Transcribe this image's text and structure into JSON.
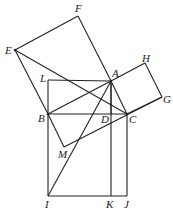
{
  "diagram": {
    "title": "",
    "points": {
      "A": {
        "x": 111,
        "y": 81,
        "label": "A"
      },
      "B": {
        "x": 48,
        "y": 114,
        "label": "B"
      },
      "C": {
        "x": 127,
        "y": 114,
        "label": "C"
      },
      "D": {
        "x": 111,
        "y": 114,
        "label": "D"
      },
      "E": {
        "x": 15,
        "y": 50,
        "label": "E"
      },
      "F": {
        "x": 78,
        "y": 16,
        "label": "F"
      },
      "G": {
        "x": 162,
        "y": 97,
        "label": "G"
      },
      "H": {
        "x": 145,
        "y": 63,
        "label": "H"
      },
      "I": {
        "x": 48,
        "y": 196,
        "label": "I"
      },
      "J": {
        "x": 127,
        "y": 196,
        "label": "J"
      },
      "K": {
        "x": 111,
        "y": 196,
        "label": "K"
      },
      "L": {
        "x": 48,
        "y": 80,
        "label": "L"
      },
      "M": {
        "x": 64,
        "y": 147,
        "label": "M"
      }
    },
    "segments": [
      [
        "E",
        "F"
      ],
      [
        "F",
        "A"
      ],
      [
        "E",
        "B"
      ],
      [
        "A",
        "B"
      ],
      [
        "A",
        "H"
      ],
      [
        "H",
        "G"
      ],
      [
        "G",
        "C"
      ],
      [
        "A",
        "C"
      ],
      [
        "B",
        "C"
      ],
      [
        "B",
        "I"
      ],
      [
        "I",
        "J"
      ],
      [
        "J",
        "C"
      ],
      [
        "A",
        "K"
      ],
      [
        "A",
        "I"
      ],
      [
        "E",
        "C"
      ],
      [
        "B",
        "M"
      ],
      [
        "M",
        "G"
      ],
      [
        "L",
        "A"
      ],
      [
        "L",
        "B"
      ],
      [
        "A",
        "D"
      ]
    ],
    "stroke_color": "#222222"
  }
}
